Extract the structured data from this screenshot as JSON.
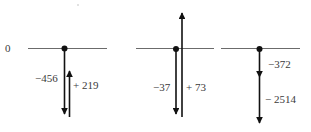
{
  "diagram": {
    "type": "number-line vector addition",
    "origin_label": "0",
    "colors": {
      "axis": "#6b6b6b",
      "arrow": "#111111",
      "text": "#3a3a3a"
    },
    "panels": [
      {
        "id": "panel-1",
        "expression": "-456 + 219",
        "vectors": [
          {
            "label": "−456",
            "value": -456,
            "direction": "down"
          },
          {
            "label": "+ 219",
            "value": 219,
            "direction": "up"
          }
        ]
      },
      {
        "id": "panel-2",
        "expression": "-37 + 73",
        "vectors": [
          {
            "label": "−37",
            "value": -37,
            "direction": "down"
          },
          {
            "label": "+ 73",
            "value": 73,
            "direction": "up"
          }
        ]
      },
      {
        "id": "panel-3",
        "expression": "-372 - 2514",
        "vectors": [
          {
            "label": "−372",
            "value": -372,
            "direction": "down"
          },
          {
            "label": "− 2514",
            "value": -2514,
            "direction": "down"
          }
        ]
      }
    ]
  }
}
